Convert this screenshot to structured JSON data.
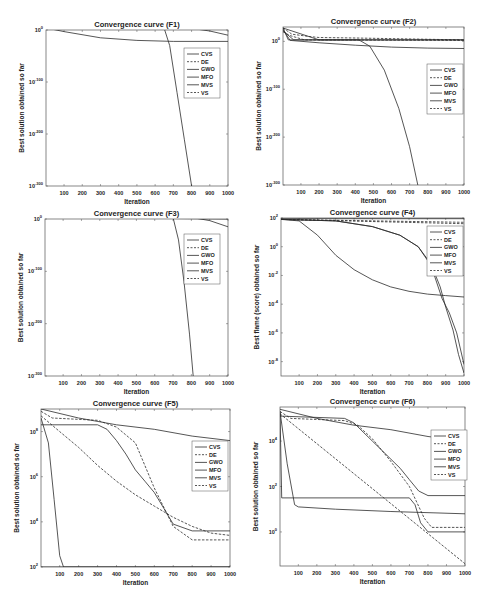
{
  "chart_data": [
    {
      "id": "F1",
      "type": "line",
      "title": "Convergence curve (F1)",
      "xlabel": "Iteration",
      "ylabel": "Best solution obtained so far",
      "yscale": "log",
      "xlim": [
        1,
        1000
      ],
      "ylim_exp": [
        -300,
        0
      ],
      "x_ticks": [
        100,
        200,
        300,
        400,
        500,
        600,
        700,
        800,
        900,
        1000
      ],
      "y_ticks": [
        {
          "exp": 0,
          "label": "10^0"
        },
        {
          "exp": -100,
          "label": "10^-100"
        },
        {
          "exp": -200,
          "label": "10^-200"
        },
        {
          "exp": -300,
          "label": "10^-300"
        }
      ],
      "legend": {
        "position": "upper-right-inside",
        "entries": [
          "CVS",
          "DE",
          "GWO",
          "MFO",
          "MVS",
          "VS"
        ]
      },
      "series": [
        {
          "name": "CVS",
          "style": "solid",
          "x": [
            1,
            650,
            680,
            720,
            760,
            800
          ],
          "y_exp": [
            4,
            3,
            -30,
            -120,
            -210,
            -300
          ]
        },
        {
          "name": "DE",
          "style": "dashed",
          "x": [
            1,
            1000
          ],
          "y_exp": [
            4,
            2
          ]
        },
        {
          "name": "GWO",
          "style": "solid",
          "x": [
            1,
            100,
            300,
            500,
            700,
            1000
          ],
          "y_exp": [
            4,
            -3,
            -15,
            -20,
            -22,
            -22
          ]
        },
        {
          "name": "MFO",
          "style": "solid",
          "x": [
            1,
            800,
            900,
            1000
          ],
          "y_exp": [
            4,
            3,
            -2,
            -10
          ]
        },
        {
          "name": "MVS",
          "style": "solid",
          "x": [
            1,
            1000
          ],
          "y_exp": [
            4,
            4
          ]
        },
        {
          "name": "VS",
          "style": "dashed",
          "x": [
            1,
            1000
          ],
          "y_exp": [
            4,
            3
          ]
        }
      ]
    },
    {
      "id": "F2",
      "type": "line",
      "title": "Convergence curve (F2)",
      "xlabel": "Iteration",
      "ylabel": "Best solution obtained so far",
      "yscale": "log",
      "xlim": [
        1,
        1000
      ],
      "ylim_exp": [
        -300,
        30
      ],
      "x_ticks": [
        100,
        200,
        300,
        400,
        500,
        600,
        700,
        800,
        900,
        1000
      ],
      "y_ticks": [
        {
          "exp": 0,
          "label": "10^0"
        },
        {
          "exp": -100,
          "label": "10^-100"
        },
        {
          "exp": -200,
          "label": "10^-200"
        },
        {
          "exp": -300,
          "label": "10^-300"
        }
      ],
      "legend": {
        "position": "upper-right-inside",
        "entries": [
          "CVS",
          "DE",
          "GWO",
          "MFO",
          "MVS",
          "VS"
        ]
      },
      "series": [
        {
          "name": "CVS",
          "style": "solid",
          "x": [
            1,
            30,
            420,
            480,
            560,
            640,
            700,
            745
          ],
          "y_exp": [
            28,
            3,
            3,
            -10,
            -60,
            -140,
            -220,
            -300
          ]
        },
        {
          "name": "DE",
          "style": "dashed",
          "x": [
            1,
            50,
            150,
            200,
            400,
            1000
          ],
          "y_exp": [
            28,
            15,
            10,
            8,
            7,
            3
          ]
        },
        {
          "name": "GWO",
          "style": "solid",
          "x": [
            1,
            40,
            200,
            400,
            600,
            800,
            1000
          ],
          "y_exp": [
            25,
            2,
            -3,
            -8,
            -12,
            -14,
            -15
          ]
        },
        {
          "name": "MFO",
          "style": "solid",
          "x": [
            1,
            200,
            1000
          ],
          "y_exp": [
            28,
            3,
            3
          ]
        },
        {
          "name": "MVS",
          "style": "solid",
          "x": [
            1,
            60,
            1000
          ],
          "y_exp": [
            22,
            3,
            3
          ]
        },
        {
          "name": "VS",
          "style": "dashed",
          "x": [
            1,
            40,
            120,
            1000
          ],
          "y_exp": [
            20,
            12,
            3,
            2
          ]
        }
      ]
    },
    {
      "id": "F3",
      "type": "line",
      "title": "Convergence curve (F3)",
      "xlabel": "Iteration",
      "ylabel": "Best solution obtained so far",
      "yscale": "log",
      "xlim": [
        1,
        1000
      ],
      "ylim_exp": [
        -300,
        0
      ],
      "x_ticks": [
        100,
        200,
        300,
        400,
        500,
        600,
        700,
        800,
        900,
        1000
      ],
      "y_ticks": [
        {
          "exp": 0,
          "label": "10^0"
        },
        {
          "exp": -100,
          "label": "10^-100"
        },
        {
          "exp": -200,
          "label": "10^-200"
        },
        {
          "exp": -300,
          "label": "10^-300"
        }
      ],
      "legend": {
        "position": "upper-right-inside",
        "entries": [
          "CVS",
          "DE",
          "GWO",
          "MFO",
          "MVS",
          "VS"
        ]
      },
      "series": [
        {
          "name": "CVS",
          "style": "solid",
          "x": [
            1,
            700,
            730,
            760,
            790,
            810
          ],
          "y_exp": [
            5,
            3,
            -40,
            -120,
            -220,
            -300
          ]
        },
        {
          "name": "DE",
          "style": "dashed",
          "x": [
            1,
            1000
          ],
          "y_exp": [
            5,
            4
          ]
        },
        {
          "name": "GWO",
          "style": "solid",
          "x": [
            1,
            300,
            700,
            1000
          ],
          "y_exp": [
            4,
            2,
            1,
            0
          ]
        },
        {
          "name": "MFO",
          "style": "solid",
          "x": [
            1,
            800,
            900,
            1000
          ],
          "y_exp": [
            5,
            3,
            -3,
            -15
          ]
        },
        {
          "name": "MVS",
          "style": "solid",
          "x": [
            1,
            1000
          ],
          "y_exp": [
            5,
            5
          ]
        },
        {
          "name": "VS",
          "style": "dashed",
          "x": [
            1,
            1000
          ],
          "y_exp": [
            5,
            4
          ]
        }
      ]
    },
    {
      "id": "F4",
      "type": "line",
      "title": "Convergence curve (F4)",
      "xlabel": "Iteration",
      "ylabel": "Best flame (score) obtained so far",
      "yscale": "log",
      "xlim": [
        1,
        1000
      ],
      "ylim_exp": [
        -9,
        2
      ],
      "x_ticks": [
        100,
        200,
        300,
        400,
        500,
        600,
        700,
        800,
        900,
        1000
      ],
      "y_ticks": [
        {
          "exp": 2,
          "label": "10^2"
        },
        {
          "exp": 0,
          "label": "10^0"
        },
        {
          "exp": -2,
          "label": "10^-2"
        },
        {
          "exp": -4,
          "label": "10^-4"
        },
        {
          "exp": -6,
          "label": "10^-6"
        },
        {
          "exp": -8,
          "label": "10^-8"
        }
      ],
      "legend": {
        "position": "upper-right-inside",
        "entries": [
          "CVS",
          "DE",
          "GWO",
          "MFO",
          "MVS",
          "VS"
        ]
      },
      "series": [
        {
          "name": "CVS",
          "style": "solid",
          "x": [
            1,
            300,
            500,
            650,
            750,
            820,
            870,
            900,
            940,
            970,
            1000
          ],
          "y_exp": [
            1.9,
            1.8,
            1.4,
            0.8,
            0,
            -1.2,
            -2.8,
            -4.2,
            -5.8,
            -7.5,
            -8.8
          ]
        },
        {
          "name": "DE",
          "style": "dashed",
          "x": [
            1,
            1000
          ],
          "y_exp": [
            1.9,
            1.7
          ]
        },
        {
          "name": "GWO",
          "style": "solid",
          "x": [
            1,
            100,
            200,
            300,
            400,
            500,
            600,
            700,
            800,
            900,
            1000
          ],
          "y_exp": [
            1.9,
            1.8,
            0.8,
            -0.6,
            -1.6,
            -2.3,
            -2.8,
            -3.1,
            -3.3,
            -3.4,
            -3.5
          ]
        },
        {
          "name": "MFO",
          "style": "solid",
          "x": [
            1,
            1000
          ],
          "y_exp": [
            1.95,
            1.95
          ]
        },
        {
          "name": "MVS",
          "style": "solid",
          "x": [
            1,
            300,
            500,
            650,
            750,
            820,
            880,
            920,
            960,
            1000
          ],
          "y_exp": [
            1.9,
            1.8,
            1.4,
            0.8,
            0,
            -1.3,
            -3.6,
            -4.6,
            -6.0,
            -8.2
          ]
        },
        {
          "name": "VS",
          "style": "dashed",
          "x": [
            1,
            1000
          ],
          "y_exp": [
            1.9,
            1.6
          ]
        }
      ]
    },
    {
      "id": "F5",
      "type": "line",
      "title": "Convergence curve (F5)",
      "xlabel": "Iteration",
      "ylabel": "Best solution obtained so far",
      "yscale": "log",
      "xlim": [
        1,
        1000
      ],
      "ylim_exp": [
        2,
        9
      ],
      "x_ticks": [
        100,
        200,
        300,
        400,
        500,
        600,
        700,
        800,
        900,
        1000
      ],
      "y_ticks": [
        {
          "exp": 8,
          "label": "10^8"
        },
        {
          "exp": 6,
          "label": "10^6"
        },
        {
          "exp": 4,
          "label": "10^4"
        },
        {
          "exp": 2,
          "label": "10^2"
        }
      ],
      "legend": {
        "position": "upper-right-inside",
        "entries": [
          "CVS",
          "DE",
          "GWO",
          "MFO",
          "MVS",
          "VS"
        ]
      },
      "series": [
        {
          "name": "CVS",
          "style": "solid",
          "x": [
            1,
            40,
            70,
            100,
            120,
            1000
          ],
          "y_exp": [
            8.6,
            7.5,
            5.0,
            2.5,
            2.0,
            2.0
          ]
        },
        {
          "name": "DE",
          "style": "dashed",
          "x": [
            1,
            60,
            300,
            400,
            500,
            600,
            700,
            800,
            1000
          ],
          "y_exp": [
            8.9,
            8.6,
            8.5,
            8.2,
            7.5,
            5.5,
            3.8,
            3.2,
            3.2
          ]
        },
        {
          "name": "GWO",
          "style": "solid",
          "x": [
            1,
            200,
            400,
            600,
            800,
            1000
          ],
          "y_exp": [
            9.0,
            8.6,
            8.3,
            8.1,
            7.8,
            7.6
          ]
        },
        {
          "name": "MFO",
          "style": "solid",
          "x": [
            1,
            300,
            350,
            400,
            450,
            500,
            550,
            600,
            650,
            700,
            800,
            1000
          ],
          "y_exp": [
            8.3,
            8.3,
            8.1,
            7.6,
            7.0,
            6.3,
            5.8,
            5.3,
            4.6,
            3.9,
            3.6,
            3.6
          ]
        },
        {
          "name": "MVS",
          "style": "solid",
          "x": [
            1,
            1000
          ],
          "y_exp": [
            2.0,
            2.0
          ]
        },
        {
          "name": "VS",
          "style": "dashed",
          "x": [
            1,
            100,
            200,
            300,
            400,
            500,
            600,
            700,
            800,
            900,
            1000
          ],
          "y_exp": [
            8.7,
            8.0,
            7.3,
            6.5,
            5.8,
            5.2,
            4.7,
            4.2,
            3.8,
            3.5,
            3.4
          ]
        }
      ]
    },
    {
      "id": "F6",
      "type": "line",
      "title": "Convergence curve (F6)",
      "xlabel": "Iteration",
      "ylabel": "Best solution obtained so far",
      "yscale": "log",
      "xlim": [
        1,
        1000
      ],
      "ylim_exp": [
        -1.5,
        5.5
      ],
      "x_ticks": [
        100,
        200,
        300,
        400,
        500,
        600,
        700,
        800,
        900,
        1000
      ],
      "y_ticks": [
        {
          "exp": 4,
          "label": "10^4"
        },
        {
          "exp": 2,
          "label": "10^2"
        },
        {
          "exp": 0,
          "label": "10^0"
        }
      ],
      "legend": {
        "position": "upper-right-inside",
        "entries": [
          "CVS",
          "DE",
          "GWO",
          "MFO",
          "MVS",
          "VS"
        ]
      },
      "series": [
        {
          "name": "CVS",
          "style": "solid",
          "x": [
            1,
            10,
            700,
            730,
            760,
            800,
            1000
          ],
          "y_exp": [
            5.3,
            1.5,
            1.5,
            1.2,
            0.4,
            0.0,
            0.0
          ]
        },
        {
          "name": "DE",
          "style": "dashed",
          "x": [
            1,
            60,
            350,
            420,
            500,
            600,
            700,
            780,
            820,
            1000
          ],
          "y_exp": [
            5.3,
            5.0,
            4.9,
            4.7,
            4.1,
            3.1,
            2.0,
            0.6,
            0.2,
            0.2
          ]
        },
        {
          "name": "GWO",
          "style": "solid",
          "x": [
            1,
            200,
            400,
            600,
            800,
            1000
          ],
          "y_exp": [
            5.4,
            5.0,
            4.7,
            4.5,
            4.2,
            4.0
          ]
        },
        {
          "name": "MFO",
          "style": "solid",
          "x": [
            1,
            350,
            400,
            450,
            500,
            550,
            600,
            650,
            700,
            750,
            800,
            1000
          ],
          "y_exp": [
            5.1,
            5.0,
            4.8,
            4.4,
            4.0,
            3.6,
            3.2,
            2.8,
            2.3,
            1.8,
            1.6,
            1.6
          ]
        },
        {
          "name": "MVS",
          "style": "solid",
          "x": [
            1,
            40,
            80,
            100,
            300,
            600,
            1000
          ],
          "y_exp": [
            5.3,
            3.0,
            1.2,
            1.1,
            1.0,
            0.9,
            0.8
          ]
        },
        {
          "name": "VS",
          "style": "dashed",
          "x": [
            1,
            1000
          ],
          "y_exp": [
            5.2,
            -1.4
          ]
        }
      ]
    }
  ],
  "panels": [
    {
      "title": "Convergence curve (F1)",
      "xlabel": "Iteration",
      "ylabel": "Best solution obtained so far"
    },
    {
      "title": "Convergence curve (F2)",
      "xlabel": "Iteration",
      "ylabel": "Best solution obtained so far"
    },
    {
      "title": "Convergence curve (F3)",
      "xlabel": "Iteration",
      "ylabel": "Best solution obtained so far"
    },
    {
      "title": "Convergence curve (F4)",
      "xlabel": "Iteration",
      "ylabel": "Best flame (score) obtained so far"
    },
    {
      "title": "Convergence curve (F5)",
      "xlabel": "Iteration",
      "ylabel": "Best solution obtained so far"
    },
    {
      "title": "Convergence curve (F6)",
      "xlabel": "Iteration",
      "ylabel": "Best solution obtained so far"
    }
  ],
  "legend_labels": [
    "CVS",
    "DE",
    "GWO",
    "MFO",
    "MVS",
    "VS"
  ],
  "colors": {
    "line": "#2b2b2b",
    "axis": "#444444",
    "background": "#ffffff"
  }
}
